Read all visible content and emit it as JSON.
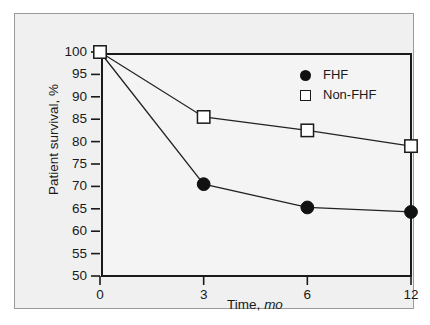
{
  "chart_data": {
    "type": "line",
    "title": "",
    "xlabel": "Time, mo",
    "xlabel_main": "Time,",
    "xlabel_unit": "mo",
    "ylabel": "Patient survival, %",
    "categories": [
      "0",
      "3",
      "6",
      "12"
    ],
    "x": [
      0,
      3,
      6,
      12
    ],
    "x_spacing": "categorical",
    "ylim": [
      50,
      100
    ],
    "yticks": [
      "100",
      "95",
      "90",
      "85",
      "80",
      "75",
      "70",
      "65",
      "60",
      "55",
      "50"
    ],
    "ytick_values": [
      100,
      95,
      90,
      85,
      80,
      75,
      70,
      65,
      60,
      55,
      50
    ],
    "xticks": [
      "0",
      "3",
      "6",
      "12"
    ],
    "grid": false,
    "legend_position": "top-right",
    "series": [
      {
        "name": "FHF",
        "marker": "filled-circle",
        "color": "#111111",
        "values": [
          100,
          70.5,
          65.3,
          64.3
        ]
      },
      {
        "name": "Non-FHF",
        "marker": "open-square",
        "color": "#1a1a1a",
        "values": [
          100,
          85.5,
          82.5,
          79.0
        ]
      }
    ]
  },
  "legend": {
    "items": [
      {
        "label": "FHF",
        "marker": "filled-circle"
      },
      {
        "label": "Non-FHF",
        "marker": "open-square"
      }
    ]
  },
  "colors": {
    "page_background": "#ffffff",
    "panel_background": "#f0f0f0",
    "plot_background": "#f4f4f4",
    "axis": "#1a1a1a",
    "line": "#222222",
    "frame_border": "#9a9a9a"
  }
}
